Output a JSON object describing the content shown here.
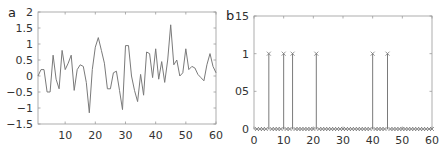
{
  "chart_data": [
    {
      "panel": "a",
      "type": "line",
      "title": "",
      "xlabel": "",
      "ylabel": "",
      "xlim": [
        1,
        60
      ],
      "ylim": [
        -1.5,
        2
      ],
      "xticks": [
        10,
        20,
        30,
        40,
        50,
        60
      ],
      "xtick_labels": [
        "10",
        "20",
        "30",
        "40",
        "50",
        "60"
      ],
      "yticks": [
        -1.5,
        -1,
        -0.5,
        0,
        0.5,
        1,
        1.5,
        2
      ],
      "ytick_labels": [
        "-1.5",
        "-1",
        "-0.5",
        "0",
        "0.5",
        "1",
        "1.5",
        "2"
      ],
      "grid": false,
      "legend": null,
      "color": "#7a7a7a",
      "x": [
        1,
        2,
        3,
        4,
        5,
        6,
        7,
        8,
        9,
        10,
        11,
        12,
        13,
        14,
        15,
        16,
        17,
        18,
        19,
        20,
        21,
        22,
        23,
        24,
        25,
        26,
        27,
        28,
        29,
        30,
        31,
        32,
        33,
        34,
        35,
        36,
        37,
        38,
        39,
        40,
        41,
        42,
        43,
        44,
        45,
        46,
        47,
        48,
        49,
        50,
        51,
        52,
        53,
        54,
        55,
        56,
        57,
        58,
        59,
        60
      ],
      "values": [
        0,
        0.2,
        0.2,
        -0.5,
        -0.5,
        0.65,
        -0.1,
        -0.4,
        0.8,
        0.2,
        0.4,
        0.65,
        -0.45,
        0.2,
        0.35,
        0.3,
        -0.2,
        -1.15,
        0.2,
        0.9,
        1.2,
        0.8,
        0.4,
        -0.4,
        -0.4,
        0.1,
        0.15,
        -0.45,
        -1.05,
        0.95,
        0.95,
        0,
        -0.45,
        -0.8,
        0.05,
        -0.6,
        0.75,
        0.7,
        -0.05,
        0.85,
        -0.1,
        0.45,
        -0.2,
        0.5,
        1.6,
        0.35,
        0.5,
        0,
        0.1,
        0.85,
        0.2,
        0.3,
        0.25,
        0.05,
        -0.05,
        -0.15,
        0.35,
        0.7,
        0.3,
        0.1
      ]
    },
    {
      "panel": "b",
      "type": "stem",
      "title": "",
      "xlabel": "",
      "ylabel": "",
      "xlim": [
        0,
        60
      ],
      "ylim": [
        0,
        1.5
      ],
      "xticks": [
        0,
        10,
        20,
        30,
        40,
        50,
        60
      ],
      "xtick_labels": [
        "0",
        "10",
        "20",
        "30",
        "40",
        "50",
        "60"
      ],
      "yticks": [
        0,
        0.5,
        1,
        1.5
      ],
      "ytick_labels": [
        "0",
        "05",
        "1",
        "15"
      ],
      "grid": false,
      "legend": null,
      "marker": "x",
      "color": "#7a7a7a",
      "x": [
        1,
        2,
        3,
        4,
        5,
        6,
        7,
        8,
        9,
        10,
        11,
        12,
        13,
        14,
        15,
        16,
        17,
        18,
        19,
        20,
        21,
        22,
        23,
        24,
        25,
        26,
        27,
        28,
        29,
        30,
        31,
        32,
        33,
        34,
        35,
        36,
        37,
        38,
        39,
        40,
        41,
        42,
        43,
        44,
        45,
        46,
        47,
        48,
        49,
        50,
        51,
        52,
        53,
        54,
        55,
        56,
        57,
        58,
        59,
        60
      ],
      "nonzero_indices": [
        5,
        10,
        13,
        21,
        40,
        45
      ],
      "values": [
        0,
        0,
        0,
        0,
        1,
        0,
        0,
        0,
        0,
        1,
        0,
        0,
        1,
        0,
        0,
        0,
        0,
        0,
        0,
        0,
        1,
        0,
        0,
        0,
        0,
        0,
        0,
        0,
        0,
        0,
        0,
        0,
        0,
        0,
        0,
        0,
        0,
        0,
        0,
        1,
        0,
        0,
        0,
        0,
        1,
        0,
        0,
        0,
        0,
        0,
        0,
        0,
        0,
        0,
        0,
        0,
        0,
        0,
        0,
        0
      ]
    }
  ],
  "panels": {
    "a": {
      "label": "a"
    },
    "b": {
      "label": "b"
    }
  }
}
